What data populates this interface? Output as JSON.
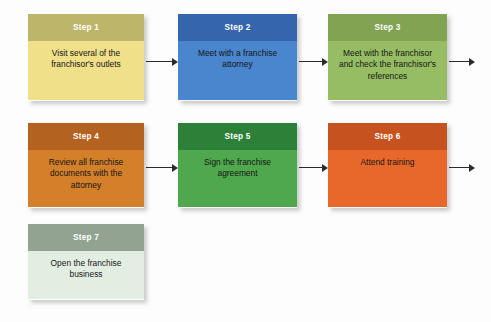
{
  "diagram": {
    "background_color": "#fdfdfd",
    "steps": [
      {
        "id": "step-1",
        "header": "Step 1",
        "body": "Visit several of the franchisor's outlets",
        "header_color": "#bdb569",
        "body_color": "#f0e08a",
        "x": 28,
        "y": 14,
        "width": 116,
        "height": 87
      },
      {
        "id": "step-2",
        "header": "Step 2",
        "body": "Meet with a franchise attorney",
        "header_color": "#3566ad",
        "body_color": "#4a86ce",
        "x": 178,
        "y": 14,
        "width": 119,
        "height": 87
      },
      {
        "id": "step-3",
        "header": "Step 3",
        "body": "Meet with the franchisor and check the franchisor's references",
        "header_color": "#81a352",
        "body_color": "#96bd63",
        "x": 328,
        "y": 14,
        "width": 119,
        "height": 87
      },
      {
        "id": "step-4",
        "header": "Step 4",
        "body": "Review all franchise documents with the attorney",
        "header_color": "#b3621f",
        "body_color": "#d4802b",
        "x": 28,
        "y": 123,
        "width": 116,
        "height": 85
      },
      {
        "id": "step-5",
        "header": "Step 5",
        "body": "Sign the franchise agreement",
        "header_color": "#2d8037",
        "body_color": "#50a84e",
        "x": 178,
        "y": 123,
        "width": 119,
        "height": 85
      },
      {
        "id": "step-6",
        "header": "Step 6",
        "body": "Attend training",
        "header_color": "#c6521f",
        "body_color": "#e8682b",
        "x": 328,
        "y": 123,
        "width": 119,
        "height": 85
      },
      {
        "id": "step-7",
        "header": "Step 7",
        "body": "Open the franchise business",
        "header_color": "#92a392",
        "body_color": "#e3eee3",
        "x": 28,
        "y": 224,
        "width": 116,
        "height": 76
      }
    ],
    "arrows": [
      {
        "id": "arrow-1-to-2",
        "x": 146,
        "y": 57,
        "length": 32
      },
      {
        "id": "arrow-2-to-3",
        "x": 299,
        "y": 57,
        "length": 29
      },
      {
        "id": "arrow-3-to-next",
        "x": 449,
        "y": 57,
        "length": 26
      },
      {
        "id": "arrow-4-to-5",
        "x": 146,
        "y": 163,
        "length": 32
      },
      {
        "id": "arrow-5-to-6",
        "x": 299,
        "y": 163,
        "length": 29
      },
      {
        "id": "arrow-6-to-next",
        "x": 449,
        "y": 163,
        "length": 26
      }
    ]
  }
}
